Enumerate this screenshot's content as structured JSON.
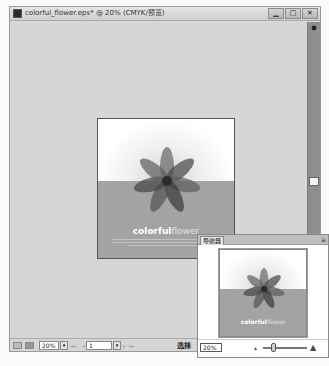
{
  "window": {
    "title": "colorful_flower.eps* @ 20% (CMYK/预览)",
    "buttons": {
      "minimize": "▁",
      "maximize": "□",
      "close": "✕"
    }
  },
  "document": {
    "title_bold": "colorful",
    "title_light": "flower",
    "colors": {
      "top": "#ffffff",
      "bottom": "#a3a3a3",
      "petal_dark": "#3a3a3a",
      "petal_mid": "#5c5c5c"
    }
  },
  "statusbar": {
    "zoom_value": "20%",
    "page_value": "1",
    "nav_first": "◂◂",
    "nav_prev": "◂",
    "nav_next": "▸",
    "nav_last": "▸▸",
    "tool_label": "选择",
    "dropdown_glyph": "▾"
  },
  "navigator": {
    "tab_label": "导航器",
    "menu_glyph": "≡",
    "zoom_value": "20%",
    "zoom_out_glyph": "▴",
    "zoom_in_glyph": "▲",
    "grip": "···"
  }
}
